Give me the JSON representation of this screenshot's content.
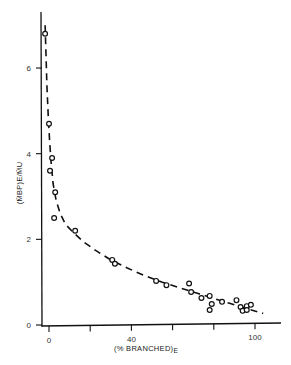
{
  "chart_data": {
    "type": "scatter",
    "title": "",
    "xlabel": "(% BRANCHED)E",
    "xlabel_main": "(% BRANCHED)",
    "xlabel_sub": "E",
    "ylabel": "(M̄BP)E/M̄U",
    "xlim": [
      -4,
      112
    ],
    "ylim": [
      0,
      7.3
    ],
    "grid": false,
    "legend": null,
    "x_ticks": [
      0,
      20,
      40,
      60,
      80,
      100
    ],
    "x_tick_labels": [
      "0",
      "",
      "40",
      "",
      "",
      "100"
    ],
    "y_ticks": [
      0,
      2,
      4,
      6
    ],
    "y_tick_labels": [
      "0",
      "2",
      "4",
      "6"
    ],
    "series": [
      {
        "name": "measured",
        "marker": "open-circle",
        "points": [
          [
            -1.9,
            6.8
          ],
          [
            0,
            4.7
          ],
          [
            1.5,
            3.9
          ],
          [
            0.5,
            3.6
          ],
          [
            3,
            3.1
          ],
          [
            2.5,
            2.5
          ],
          [
            12.7,
            2.2
          ],
          [
            30.7,
            1.52
          ],
          [
            32,
            1.43
          ],
          [
            52,
            1.03
          ],
          [
            57,
            0.93
          ],
          [
            68,
            0.97
          ],
          [
            69,
            0.77
          ],
          [
            74,
            0.63
          ],
          [
            78,
            0.68
          ],
          [
            79,
            0.49
          ],
          [
            78,
            0.35
          ],
          [
            84,
            0.54
          ],
          [
            91,
            0.58
          ],
          [
            93,
            0.42
          ],
          [
            94,
            0.33
          ],
          [
            96,
            0.44
          ],
          [
            98,
            0.47
          ],
          [
            96,
            0.35
          ]
        ]
      },
      {
        "name": "fit",
        "style": "dashed-line",
        "points": [
          [
            -1.9,
            7.0
          ],
          [
            -1.5,
            6.4
          ],
          [
            -1.0,
            5.6
          ],
          [
            -0.4,
            4.9
          ],
          [
            0.3,
            4.3
          ],
          [
            1.0,
            3.8
          ],
          [
            2.0,
            3.3
          ],
          [
            3.5,
            2.9
          ],
          [
            5.5,
            2.6
          ],
          [
            8,
            2.35
          ],
          [
            12,
            2.15
          ],
          [
            17,
            1.93
          ],
          [
            23,
            1.73
          ],
          [
            30,
            1.52
          ],
          [
            38,
            1.33
          ],
          [
            46,
            1.16
          ],
          [
            55,
            1.0
          ],
          [
            64,
            0.86
          ],
          [
            72,
            0.74
          ],
          [
            80,
            0.62
          ],
          [
            88,
            0.5
          ],
          [
            96,
            0.38
          ],
          [
            104,
            0.27
          ]
        ]
      }
    ]
  }
}
